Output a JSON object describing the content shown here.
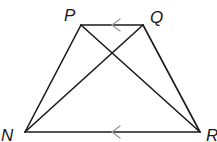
{
  "diagram": {
    "type": "trapezoid",
    "points": {
      "P": {
        "label": "P",
        "x": 81,
        "y": 25
      },
      "Q": {
        "label": "Q",
        "x": 143,
        "y": 25
      },
      "N": {
        "label": "N",
        "x": 25,
        "y": 132
      },
      "R": {
        "label": "R",
        "x": 200,
        "y": 132
      }
    },
    "segments": [
      "PQ",
      "QR",
      "RN",
      "NP",
      "PR",
      "QN"
    ],
    "parallel_marks": [
      "PQ",
      "NR"
    ],
    "line_color": "#1a1a1a",
    "mark_color": "#9a9a9a"
  }
}
